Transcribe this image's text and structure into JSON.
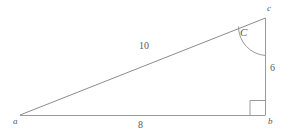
{
  "diagram": {
    "type": "right-triangle",
    "stroke_color": "#8c8c8c",
    "text_color": "#5a5a5a",
    "background_color": "#ffffff",
    "vertices": [
      {
        "id": "a",
        "label": "a",
        "x": 20,
        "y": 115
      },
      {
        "id": "b",
        "label": "b",
        "x": 265,
        "y": 115
      },
      {
        "id": "c",
        "label": "c",
        "x": 265,
        "y": 18
      }
    ],
    "sides": [
      {
        "id": "ab",
        "label": "8",
        "from": "a",
        "to": "b",
        "description": "base"
      },
      {
        "id": "bc",
        "label": "6",
        "from": "b",
        "to": "c",
        "description": "vertical-leg"
      },
      {
        "id": "ca",
        "label": "10",
        "from": "c",
        "to": "a",
        "description": "hypotenuse"
      }
    ],
    "angles": [
      {
        "id": "C",
        "label": "C",
        "at_vertex": "c",
        "marker": "arc"
      },
      {
        "id": "B",
        "label": "",
        "at_vertex": "b",
        "marker": "right-angle-square"
      }
    ]
  }
}
